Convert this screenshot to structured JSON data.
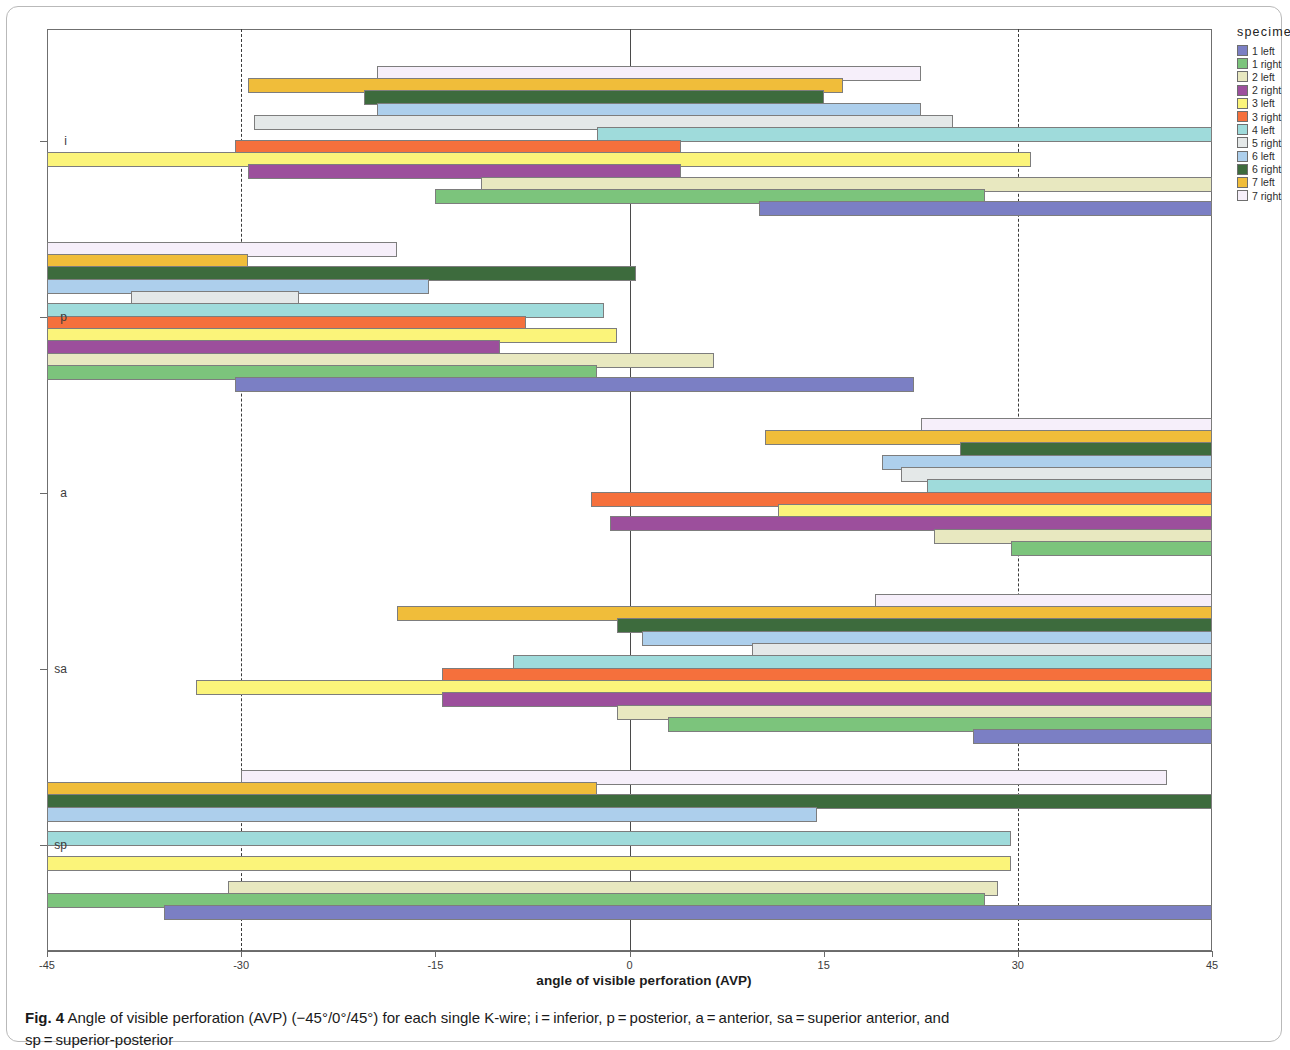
{
  "figure": {
    "caption_label": "Fig. 4",
    "caption_text": " Angle of visible perforation (AVP) (−45°/0°/45°) for each single K-wire; i = inferior, p = posterior, a = anterior, sa = superior anterior, and",
    "caption_line2": "sp = superior-posterior"
  },
  "legend": {
    "title": "specimen",
    "items": [
      {
        "label": "1 left",
        "color": "#7b7fc4"
      },
      {
        "label": "1 right",
        "color": "#7cc47c"
      },
      {
        "label": "2 left",
        "color": "#e8e8c0"
      },
      {
        "label": "2 right",
        "color": "#9c4f9c"
      },
      {
        "label": "3 left",
        "color": "#fbf47a"
      },
      {
        "label": "3 right",
        "color": "#f5703c"
      },
      {
        "label": "4 left",
        "color": "#9fdbdb"
      },
      {
        "label": "5 right",
        "color": "#e4e8e8"
      },
      {
        "label": "6 left",
        "color": "#adcfec"
      },
      {
        "label": "6 right",
        "color": "#3d6b3d"
      },
      {
        "label": "7 left",
        "color": "#f0bd3a"
      },
      {
        "label": "7 right",
        "color": "#f6effa"
      }
    ]
  },
  "chart_data": {
    "type": "bar",
    "orientation": "horizontal",
    "title": "",
    "xlabel": "angle of visible perforation (AVP)",
    "ylabel": "",
    "xlim": [
      -45,
      45
    ],
    "xticks": [
      -45,
      -30,
      -15,
      0,
      15,
      30,
      45
    ],
    "xticklabels": [
      "-45",
      "-30",
      "-15",
      "0",
      "15",
      "30",
      "45"
    ],
    "gridlines_dashed_at": [
      -30,
      30
    ],
    "zero_line_at": 0,
    "grid": false,
    "legend_position": "right",
    "categories": [
      "i",
      "p",
      "a",
      "sa",
      "sp"
    ],
    "category_labels": {
      "i": "i",
      "p": "p",
      "a": "a",
      "sa": "sa",
      "sp": "sp"
    },
    "series_order_top_to_bottom": [
      "7 right",
      "7 left",
      "6 right",
      "6 left",
      "5 right",
      "4 left",
      "3 right",
      "3 left",
      "2 right",
      "2 left",
      "1 right",
      "1 left"
    ],
    "bars": {
      "i": [
        {
          "specimen": "7 right",
          "start": -19.5,
          "end": 22.5
        },
        {
          "specimen": "7 left",
          "start": -29.5,
          "end": 16.5
        },
        {
          "specimen": "6 right",
          "start": -20.5,
          "end": 15.0
        },
        {
          "specimen": "6 left",
          "start": -19.5,
          "end": 22.5
        },
        {
          "specimen": "5 right",
          "start": -29.0,
          "end": 25.0
        },
        {
          "specimen": "4 left",
          "start": -2.5,
          "end": 45.0
        },
        {
          "specimen": "3 right",
          "start": -30.5,
          "end": 4.0
        },
        {
          "specimen": "3 left",
          "start": -45.0,
          "end": 31.0
        },
        {
          "specimen": "2 right",
          "start": -29.5,
          "end": 4.0
        },
        {
          "specimen": "2 left",
          "start": -11.5,
          "end": 45.0
        },
        {
          "specimen": "1 right",
          "start": -15.0,
          "end": 27.5
        },
        {
          "specimen": "1 left",
          "start": 10.0,
          "end": 45.0
        }
      ],
      "p": [
        {
          "specimen": "7 right",
          "start": -45.0,
          "end": -18.0
        },
        {
          "specimen": "7 left",
          "start": -45.0,
          "end": -29.5
        },
        {
          "specimen": "6 right",
          "start": -45.0,
          "end": 0.5
        },
        {
          "specimen": "6 left",
          "start": -45.0,
          "end": -15.5
        },
        {
          "specimen": "5 right",
          "start": -38.5,
          "end": -25.5
        },
        {
          "specimen": "4 left",
          "start": -45.0,
          "end": -2.0
        },
        {
          "specimen": "3 right",
          "start": -45.0,
          "end": -8.0
        },
        {
          "specimen": "3 left",
          "start": -45.0,
          "end": -1.0
        },
        {
          "specimen": "2 right",
          "start": -45.0,
          "end": -10.0
        },
        {
          "specimen": "2 left",
          "start": -45.0,
          "end": 6.5
        },
        {
          "specimen": "1 right",
          "start": -45.0,
          "end": -2.5
        },
        {
          "specimen": "1 left",
          "start": -30.5,
          "end": 22.0
        }
      ],
      "a": [
        {
          "specimen": "7 right",
          "start": 22.5,
          "end": 45.0
        },
        {
          "specimen": "7 left",
          "start": 10.5,
          "end": 45.0
        },
        {
          "specimen": "6 right",
          "start": 25.5,
          "end": 45.0
        },
        {
          "specimen": "6 left",
          "start": 19.5,
          "end": 45.0
        },
        {
          "specimen": "5 right",
          "start": 21.0,
          "end": 45.0
        },
        {
          "specimen": "4 left",
          "start": 23.0,
          "end": 45.0
        },
        {
          "specimen": "3 right",
          "start": -3.0,
          "end": 45.0
        },
        {
          "specimen": "3 left",
          "start": 11.5,
          "end": 45.0
        },
        {
          "specimen": "2 right",
          "start": -1.5,
          "end": 45.0
        },
        {
          "specimen": "2 left",
          "start": 23.5,
          "end": 45.0
        },
        {
          "specimen": "1 right",
          "start": 29.5,
          "end": 45.0
        }
      ],
      "sa": [
        {
          "specimen": "7 right",
          "start": 19.0,
          "end": 45.0
        },
        {
          "specimen": "7 left",
          "start": -18.0,
          "end": 45.0
        },
        {
          "specimen": "6 right",
          "start": -1.0,
          "end": 45.0
        },
        {
          "specimen": "6 left",
          "start": 1.0,
          "end": 45.0
        },
        {
          "specimen": "5 right",
          "start": 9.5,
          "end": 45.0
        },
        {
          "specimen": "4 left",
          "start": -9.0,
          "end": 45.0
        },
        {
          "specimen": "3 right",
          "start": -14.5,
          "end": 45.0
        },
        {
          "specimen": "3 left",
          "start": -33.5,
          "end": 45.0
        },
        {
          "specimen": "2 right",
          "start": -14.5,
          "end": 45.0
        },
        {
          "specimen": "2 left",
          "start": -1.0,
          "end": 45.0
        },
        {
          "specimen": "1 right",
          "start": 3.0,
          "end": 45.0
        },
        {
          "specimen": "1 left",
          "start": 26.5,
          "end": 45.0
        }
      ],
      "sp": [
        {
          "specimen": "7 right",
          "start": -30.0,
          "end": 41.5
        },
        {
          "specimen": "7 left",
          "start": -45.0,
          "end": -2.5
        },
        {
          "specimen": "6 right",
          "start": -45.0,
          "end": 45.0
        },
        {
          "specimen": "6 left",
          "start": -45.0,
          "end": 14.5
        },
        {
          "specimen": "4 left",
          "start": -45.0,
          "end": 29.5
        },
        {
          "specimen": "3 left",
          "start": -45.0,
          "end": 29.5
        },
        {
          "specimen": "2 left",
          "start": -31.0,
          "end": 28.5
        },
        {
          "specimen": "1 right",
          "start": -45.0,
          "end": 27.5
        },
        {
          "specimen": "1 left",
          "start": -36.0,
          "end": 45.0
        }
      ]
    }
  }
}
